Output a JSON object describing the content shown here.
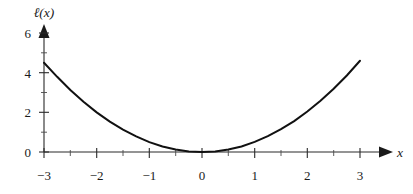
{
  "figure": {
    "background_color": "#ffffff",
    "curve_color": "#111111",
    "axis_color": "#2a2a2a"
  },
  "axes": {
    "y_axis_name": "ℓ(x)",
    "x_axis_name": "x",
    "x_ticks": [
      "−3",
      "−2",
      "−1",
      "0",
      "1",
      "2",
      "3"
    ],
    "y_ticks": [
      "0",
      "2",
      "4",
      "6"
    ]
  },
  "chart_data": {
    "type": "line",
    "title": "",
    "xlabel": "x",
    "ylabel": "ℓ(x)",
    "xlim": [
      -3,
      3
    ],
    "ylim": [
      0,
      6
    ],
    "grid": false,
    "legend": "none",
    "x_tick_values": [
      -3,
      -2,
      -1,
      0,
      1,
      2,
      3
    ],
    "y_tick_values": [
      0,
      2,
      4,
      6
    ],
    "x_minor_tick_step": 0.5,
    "y_minor_tick_step": 1,
    "series": [
      {
        "name": "ℓ(x)",
        "x": [
          -3.0,
          -2.75,
          -2.5,
          -2.25,
          -2.0,
          -1.75,
          -1.5,
          -1.25,
          -1.0,
          -0.75,
          -0.5,
          -0.25,
          0.0,
          0.25,
          0.5,
          0.75,
          1.0,
          1.25,
          1.5,
          1.75,
          2.0,
          2.25,
          2.5,
          2.75,
          3.0
        ],
        "y": [
          4.5,
          3.79,
          3.13,
          2.53,
          2.0,
          1.53,
          1.13,
          0.79,
          0.5,
          0.28,
          0.13,
          0.03,
          0.0,
          0.03,
          0.13,
          0.28,
          0.51,
          0.8,
          1.15,
          1.56,
          2.04,
          2.58,
          3.19,
          3.86,
          4.6
        ]
      }
    ]
  }
}
